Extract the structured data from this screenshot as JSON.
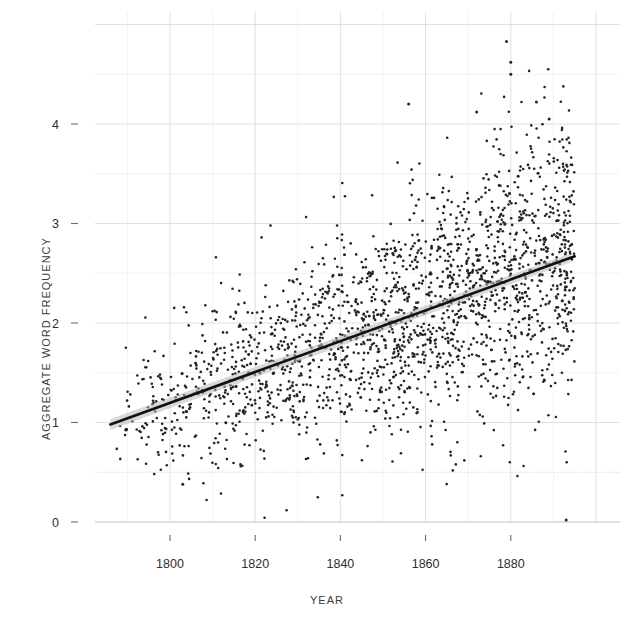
{
  "figure": {
    "background": "#ffffff",
    "point_color": "#232323",
    "line_color": "#111111",
    "band_color": "#b9b9b9",
    "grid_color": "#dcdcdc"
  },
  "axes": {
    "x_label": "YEAR",
    "y_label": "AGGREGATE WORD FREQUENCY",
    "x_ticks": [
      "1800",
      "1820",
      "1840",
      "1860",
      "1880"
    ],
    "y_ticks": [
      "0",
      "1",
      "2",
      "3",
      "4"
    ]
  },
  "chart_data": {
    "type": "scatter",
    "title": "",
    "xlabel": "YEAR",
    "ylabel": "AGGREGATE WORD FREQUENCY",
    "xlim": [
      1784,
      1898
    ],
    "ylim": [
      -0.1,
      5.05
    ],
    "xticks": [
      1800,
      1820,
      1840,
      1860,
      1880
    ],
    "yticks": [
      0,
      1,
      2,
      3,
      4
    ],
    "grid": true,
    "grid_minor_step_x": 10,
    "grid_minor_step_y": 0.5,
    "legend": "none",
    "n_points": 2100,
    "point_size_px": 2.6,
    "series": [
      {
        "name": "aggregate word frequency",
        "kind": "scatter",
        "x_range": [
          1786,
          1895
        ],
        "y_range": [
          0.02,
          4.85
        ],
        "description": "dense cloud of yearly observations, spread widens with time",
        "spread_model": {
          "sd_start": 0.3,
          "sd_end": 0.72,
          "density_start": 0.25,
          "density_end": 1.0
        }
      },
      {
        "name": "linear fit",
        "kind": "line",
        "x": [
          1786,
          1895
        ],
        "y": [
          0.98,
          2.67
        ],
        "slope_per_year": 0.0155,
        "intercept_1786": 0.98
      },
      {
        "name": "confidence band",
        "kind": "band",
        "x": [
          1786,
          1895
        ],
        "half_width": [
          0.055,
          0.045
        ]
      }
    ],
    "notable_outliers": [
      {
        "x": 1879,
        "y": 4.83
      },
      {
        "x": 1880,
        "y": 4.62
      },
      {
        "x": 1880,
        "y": 4.5
      },
      {
        "x": 1886,
        "y": 4.22
      },
      {
        "x": 1889,
        "y": 4.05
      },
      {
        "x": 1872,
        "y": 4.12
      },
      {
        "x": 1856,
        "y": 4.2
      },
      {
        "x": 1893,
        "y": 0.02
      },
      {
        "x": 1803,
        "y": 0.38
      }
    ]
  }
}
